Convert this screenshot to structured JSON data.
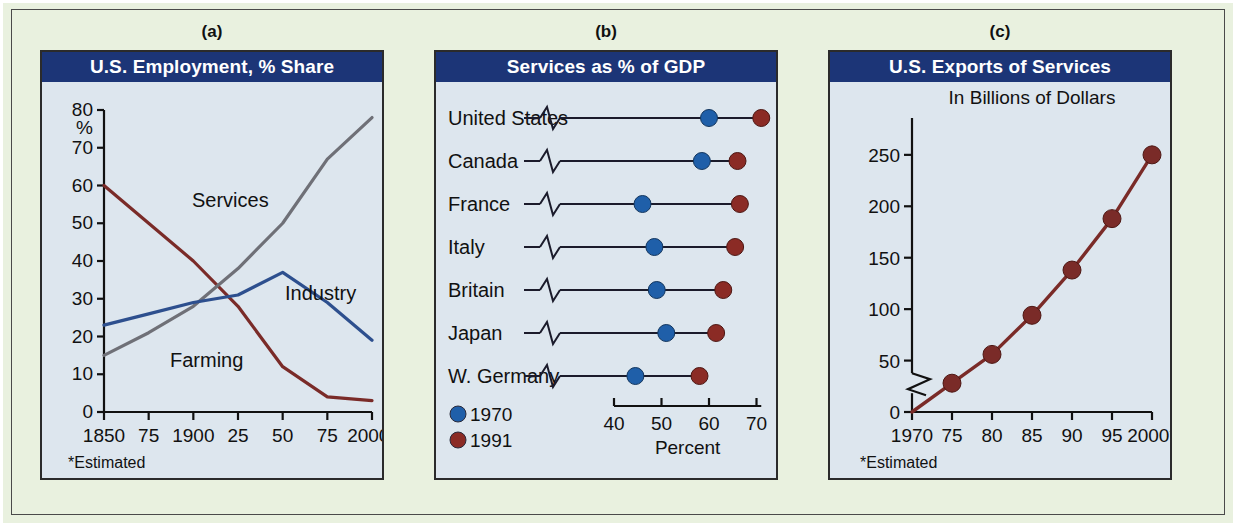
{
  "figure": {
    "background_color": "#e9f1df",
    "panel_background_color": "#dde6ee",
    "header_color": "#1c3577",
    "series_colors": {
      "farming": "#7a2b28",
      "services": "#6f7077",
      "industry": "#2d4f8e",
      "year_1970": "#1f5fa9",
      "year_1991": "#8b2b25"
    }
  },
  "panels": [
    {
      "letter": "(a)",
      "title": "U.S. Employment, % Share",
      "footnote": "*Estimated",
      "y_axis_unit": "%"
    },
    {
      "letter": "(b)",
      "title": "Services as % of GDP",
      "x_title": "Percent"
    },
    {
      "letter": "(c)",
      "title": "U.S. Exports of Services",
      "subtitle": "In Billions of Dollars",
      "footnote": "*Estimated"
    }
  ],
  "chart_data": [
    {
      "type": "line",
      "panel": "(a)",
      "title": "U.S. Employment, % Share",
      "xlabel": "",
      "ylabel": "%",
      "ylim": [
        0,
        80
      ],
      "yticks": [
        0,
        10,
        20,
        30,
        40,
        50,
        60,
        70,
        80
      ],
      "ytick_labels": [
        "0",
        "10",
        "20",
        "30",
        "40",
        "50",
        "60",
        "70",
        "80"
      ],
      "xlim": [
        1850,
        2000
      ],
      "xticks": [
        1850,
        1875,
        1900,
        1925,
        1950,
        1975,
        2000
      ],
      "xtick_labels": [
        "1850",
        "75",
        "1900",
        "25",
        "50",
        "75",
        "2000*"
      ],
      "grid": false,
      "legend": "inline-labels",
      "annotations": [
        "Services",
        "Industry",
        "Farming"
      ],
      "footnote": "*Estimated",
      "x": [
        1850,
        1875,
        1900,
        1925,
        1950,
        1975,
        2000
      ],
      "series": [
        {
          "name": "Farming",
          "color": "#7a2b28",
          "values": [
            60,
            50,
            40,
            28,
            12,
            4,
            3
          ]
        },
        {
          "name": "Services",
          "color": "#6f7077",
          "values": [
            15,
            21,
            28,
            38,
            50,
            67,
            78
          ]
        },
        {
          "name": "Industry",
          "color": "#2d4f8e",
          "values": [
            23,
            26,
            29,
            31,
            37,
            29,
            19
          ]
        }
      ]
    },
    {
      "type": "bar",
      "subtype": "dumbbell",
      "panel": "(b)",
      "title": "Services as % of GDP",
      "xlabel": "Percent",
      "ylabel": "",
      "xlim": [
        40,
        72
      ],
      "xticks": [
        40,
        50,
        60,
        70
      ],
      "xtick_labels": [
        "40",
        "50",
        "60",
        "70"
      ],
      "axis_break": true,
      "grid": false,
      "legend": [
        "1970",
        "1991"
      ],
      "legend_position": "bottom-left",
      "categories": [
        "United States",
        "Canada",
        "France",
        "Italy",
        "Britain",
        "Japan",
        "W. Germany"
      ],
      "series": [
        {
          "name": "1970",
          "color": "#1f5fa9",
          "values": [
            60,
            58.5,
            46,
            48.5,
            49,
            51,
            44.5
          ]
        },
        {
          "name": "1991",
          "color": "#8b2b25",
          "values": [
            71,
            66,
            66.5,
            65.5,
            63,
            61.5,
            58
          ]
        }
      ]
    },
    {
      "type": "line",
      "panel": "(c)",
      "title": "U.S. Exports of Services",
      "subtitle": "In Billions of Dollars",
      "xlabel": "",
      "ylabel": "",
      "ylim": [
        0,
        280
      ],
      "yticks": [
        0,
        50,
        100,
        150,
        200,
        250
      ],
      "ytick_labels": [
        "0",
        "50",
        "100",
        "150",
        "200",
        "250"
      ],
      "axis_break": true,
      "xlim": [
        1970,
        2000
      ],
      "xticks": [
        1970,
        1975,
        1980,
        1985,
        1990,
        1995,
        2000
      ],
      "xtick_labels": [
        "1970",
        "75",
        "80",
        "85",
        "90",
        "95",
        "2000*"
      ],
      "grid": false,
      "footnote": "*Estimated",
      "x": [
        1970,
        1975,
        1980,
        1985,
        1990,
        1995,
        2000
      ],
      "series": [
        {
          "name": "U.S. Exports of Services",
          "color": "#7a2b28",
          "values": [
            0,
            28,
            56,
            94,
            138,
            188,
            250
          ],
          "markers_at": [
            1975,
            1980,
            1985,
            1990,
            1995,
            2000
          ]
        }
      ]
    }
  ]
}
